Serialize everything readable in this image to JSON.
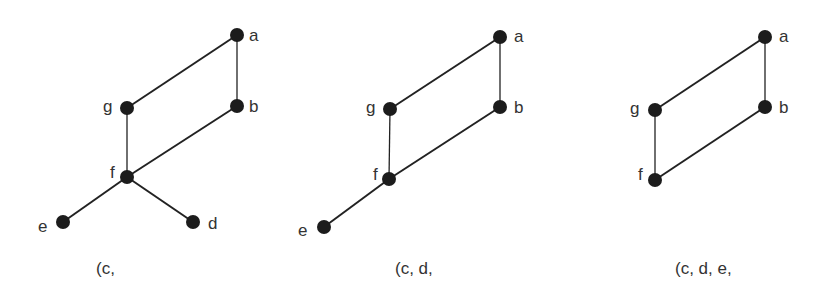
{
  "panels": [
    {
      "caption": "(c,",
      "nodes": [
        {
          "id": "a",
          "x": 237,
          "y": 35,
          "lx": 249,
          "ly": 41
        },
        {
          "id": "b",
          "x": 237,
          "y": 106,
          "lx": 249,
          "ly": 112
        },
        {
          "id": "g",
          "x": 127,
          "y": 108,
          "lx": 103,
          "ly": 112
        },
        {
          "id": "f",
          "x": 127,
          "y": 177,
          "lx": 110,
          "ly": 178
        },
        {
          "id": "e",
          "x": 63,
          "y": 222,
          "lx": 38,
          "ly": 232
        },
        {
          "id": "d",
          "x": 193,
          "y": 222,
          "lx": 208,
          "ly": 229
        }
      ],
      "edges": [
        [
          "a",
          "g"
        ],
        [
          "a",
          "b"
        ],
        [
          "g",
          "f"
        ],
        [
          "b",
          "f"
        ],
        [
          "f",
          "e"
        ],
        [
          "f",
          "d"
        ]
      ]
    },
    {
      "caption": "(c, d,",
      "nodes": [
        {
          "id": "a",
          "x": 500,
          "y": 37,
          "lx": 514,
          "ly": 42
        },
        {
          "id": "b",
          "x": 500,
          "y": 107,
          "lx": 514,
          "ly": 113
        },
        {
          "id": "g",
          "x": 390,
          "y": 109,
          "lx": 366,
          "ly": 113
        },
        {
          "id": "f",
          "x": 389,
          "y": 179,
          "lx": 373,
          "ly": 180
        },
        {
          "id": "e",
          "x": 324,
          "y": 227,
          "lx": 298,
          "ly": 236
        }
      ],
      "edges": [
        [
          "a",
          "g"
        ],
        [
          "a",
          "b"
        ],
        [
          "g",
          "f"
        ],
        [
          "b",
          "f"
        ],
        [
          "f",
          "e"
        ]
      ]
    },
    {
      "caption": "(c, d, e,",
      "nodes": [
        {
          "id": "a",
          "x": 765,
          "y": 37,
          "lx": 779,
          "ly": 42
        },
        {
          "id": "b",
          "x": 765,
          "y": 107,
          "lx": 779,
          "ly": 113
        },
        {
          "id": "g",
          "x": 655,
          "y": 110,
          "lx": 630,
          "ly": 114
        },
        {
          "id": "f",
          "x": 655,
          "y": 180,
          "lx": 638,
          "ly": 180
        }
      ],
      "edges": [
        [
          "a",
          "g"
        ],
        [
          "a",
          "b"
        ],
        [
          "g",
          "f"
        ],
        [
          "b",
          "f"
        ]
      ]
    }
  ],
  "captions": {
    "p1": "(c,",
    "p2": "(c, d,",
    "p3": "(c, d, e,"
  }
}
